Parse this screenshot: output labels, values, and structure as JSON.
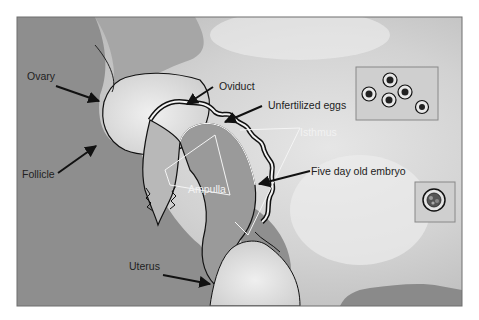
{
  "figure": {
    "colors": {
      "frame": "#6e6e6e",
      "background_dark": "#8c8c8c",
      "background_light": "#e4e4e4",
      "outline": "#111111",
      "label_dark": "#222222",
      "label_light": "#f2f2f2"
    },
    "labels": {
      "ovary": "Ovary",
      "follicle": "Follicle",
      "oviduct": "Oviduct",
      "unfertilized_eggs": "Unfertilized eggs",
      "isthmus": "Isthmus",
      "ampulla": "Ampulla",
      "five_day_embryo": "Five day old embryo",
      "uterus": "Uterus"
    },
    "insets": {
      "eggs_count": 5,
      "embryo_count": 1
    }
  }
}
